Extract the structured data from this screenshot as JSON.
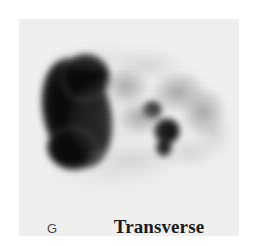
{
  "figure": {
    "panel_letter": "G",
    "view_label": "Transverse",
    "modality": "nuclear-medicine-scintigram",
    "background_color": "#f2f2f1",
    "page_background_color": "#ffffff",
    "panel": {
      "x": 19,
      "y": 19,
      "width": 220,
      "height": 217
    }
  },
  "scan": {
    "colormap": "grayscale-inverted",
    "description": "Transverse nuclear medicine scintigraphic slice showing one large intense focus of tracer uptake at the left, two discrete focal hot spots at the centre-right, and diffuse mottled low-grade uptake across the upper-right field.",
    "regions": [
      {
        "name": "dominant-uptake-mass",
        "kind": "mass-core",
        "intensity": "intense",
        "cx": 77,
        "cy": 113,
        "rx": 34,
        "ry": 56,
        "rotate": -13
      },
      {
        "name": "dominant-uptake-mass-upper-lobe",
        "kind": "mass-core",
        "intensity": "intense",
        "cx": 85,
        "cy": 78,
        "rx": 25,
        "ry": 24,
        "rotate": -20
      },
      {
        "name": "dominant-uptake-mass-lower-lobe",
        "kind": "mass-core",
        "intensity": "intense",
        "cx": 73,
        "cy": 148,
        "rx": 26,
        "ry": 22,
        "rotate": 8
      },
      {
        "name": "focal-hotspot-superior",
        "kind": "hotspot",
        "intensity": "intense",
        "cx": 152,
        "cy": 110,
        "rx": 10,
        "ry": 9,
        "rotate": 0
      },
      {
        "name": "focal-hotspot-inferior",
        "kind": "hotspot",
        "intensity": "intense",
        "cx": 167,
        "cy": 131,
        "rx": 13,
        "ry": 13,
        "rotate": 0
      },
      {
        "name": "focal-hotspot-inferior-tail",
        "kind": "hotspot",
        "intensity": "moderate",
        "cx": 164,
        "cy": 148,
        "rx": 8,
        "ry": 9,
        "rotate": 0
      },
      {
        "name": "diffuse-uptake-upper-central",
        "kind": "diffuse",
        "intensity": "moderate",
        "cx": 126,
        "cy": 86,
        "rx": 22,
        "ry": 18,
        "rotate": 12
      },
      {
        "name": "diffuse-uptake-upper-right",
        "kind": "diffuse",
        "intensity": "moderate",
        "cx": 178,
        "cy": 92,
        "rx": 26,
        "ry": 20,
        "rotate": -8
      },
      {
        "name": "diffuse-uptake-right-lateral",
        "kind": "diffuse",
        "intensity": "moderate",
        "cx": 203,
        "cy": 112,
        "rx": 22,
        "ry": 24,
        "rotate": 0
      },
      {
        "name": "diffuse-uptake-mid-central",
        "kind": "diffuse",
        "intensity": "mild",
        "cx": 140,
        "cy": 118,
        "rx": 20,
        "ry": 16,
        "rotate": 0
      },
      {
        "name": "faint-uptake-superior-rim",
        "kind": "faint",
        "intensity": "mild",
        "cx": 148,
        "cy": 66,
        "rx": 34,
        "ry": 15,
        "rotate": 0
      },
      {
        "name": "faint-uptake-right-edge",
        "kind": "faint",
        "intensity": "mild",
        "cx": 214,
        "cy": 134,
        "rx": 17,
        "ry": 22,
        "rotate": 0
      },
      {
        "name": "faint-uptake-inferior-band",
        "kind": "faint",
        "intensity": "faint",
        "cx": 132,
        "cy": 160,
        "rx": 48,
        "ry": 16,
        "rotate": 0
      },
      {
        "name": "faint-uptake-inferior-right",
        "kind": "faint",
        "intensity": "faint",
        "cx": 190,
        "cy": 152,
        "rx": 26,
        "ry": 16,
        "rotate": 0
      },
      {
        "name": "background-haze-central",
        "kind": "wisp",
        "intensity": "faint",
        "cx": 120,
        "cy": 120,
        "rx": 52,
        "ry": 44,
        "rotate": 0
      },
      {
        "name": "background-haze-inferior",
        "kind": "wisp",
        "intensity": "faint",
        "cx": 110,
        "cy": 175,
        "rx": 58,
        "ry": 14,
        "rotate": 0
      },
      {
        "name": "background-haze-superior",
        "kind": "wisp",
        "intensity": "faint",
        "cx": 110,
        "cy": 58,
        "rx": 56,
        "ry": 14,
        "rotate": 0
      }
    ]
  }
}
